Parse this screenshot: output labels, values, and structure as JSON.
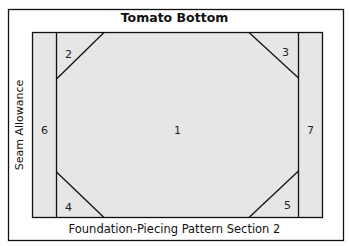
{
  "title": "Tomato Bottom",
  "footer": "Foundation-Piecing Pattern Section 2",
  "side_label": "Seam Allowance",
  "pieces": [
    {
      "id": "1",
      "label": "1"
    },
    {
      "id": "2",
      "label": "2"
    },
    {
      "id": "3",
      "label": "3"
    },
    {
      "id": "4",
      "label": "4"
    },
    {
      "id": "5",
      "label": "5"
    },
    {
      "id": "6",
      "label": "6"
    },
    {
      "id": "7",
      "label": "7"
    }
  ],
  "colors": {
    "fill": "#e6e6e6",
    "line": "#111111",
    "background": "#ffffff"
  }
}
